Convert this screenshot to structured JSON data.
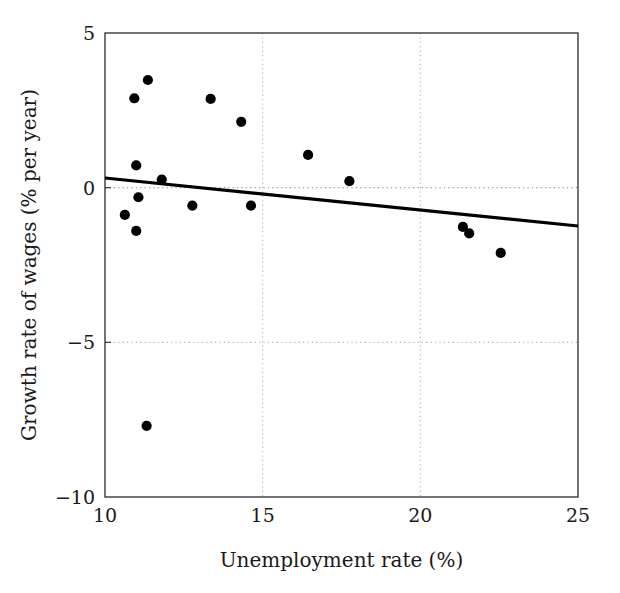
{
  "chart_data": {
    "type": "scatter",
    "title": "",
    "subtitle": "",
    "xlabel": "Unemployment rate (%)",
    "ylabel": "Growth rate of wages (% per year)",
    "xlim": [
      10,
      25
    ],
    "ylim": [
      -10,
      5
    ],
    "xticks": [
      "10",
      "15",
      "20",
      "25"
    ],
    "xtick_values": [
      10,
      15,
      20,
      25
    ],
    "yticks": [
      "5",
      "0",
      "−5",
      "−10"
    ],
    "ytick_values": [
      5,
      0,
      -5,
      -10
    ],
    "grid": "dotted gridlines at x=15, x=20 and y=0, y=-5",
    "grid_x": [
      15,
      20
    ],
    "grid_y": [
      0,
      -5
    ],
    "legend": "none",
    "legend_position": "none",
    "marker": "filled-circle",
    "marker_color": "#000000",
    "points": [
      {
        "x": 10.63,
        "y": -0.88
      },
      {
        "x": 10.93,
        "y": 2.89
      },
      {
        "x": 10.99,
        "y": 0.72
      },
      {
        "x": 11.06,
        "y": -0.31
      },
      {
        "x": 10.99,
        "y": -1.4
      },
      {
        "x": 11.36,
        "y": 3.48
      },
      {
        "x": 11.32,
        "y": -7.7
      },
      {
        "x": 11.8,
        "y": 0.26
      },
      {
        "x": 12.77,
        "y": -0.58
      },
      {
        "x": 13.35,
        "y": 2.87
      },
      {
        "x": 14.32,
        "y": 2.13
      },
      {
        "x": 14.63,
        "y": -0.58
      },
      {
        "x": 16.44,
        "y": 1.06
      },
      {
        "x": 17.75,
        "y": 0.21
      },
      {
        "x": 21.35,
        "y": -1.27
      },
      {
        "x": 21.55,
        "y": -1.48
      },
      {
        "x": 22.55,
        "y": -2.11
      }
    ],
    "trendline": {
      "label": "fitted regression line",
      "x_start": 10,
      "y_start": 0.31,
      "x_end": 25,
      "y_end": -1.24,
      "slope": -0.103,
      "intercept": 1.34,
      "color": "#000000"
    }
  },
  "axes": {
    "x_title": "Unemployment rate (%)",
    "y_title": "Growth rate of wages (% per year)",
    "x_tick_labels": [
      "10",
      "15",
      "20",
      "25"
    ],
    "y_tick_labels": [
      "5",
      "0",
      "−5",
      "−10"
    ]
  },
  "style": {
    "frame_color": "#3a3a3a",
    "grid_color": "#b9b9b9",
    "marker_color": "#000000",
    "line_color": "#000000",
    "background": "#ffffff"
  }
}
